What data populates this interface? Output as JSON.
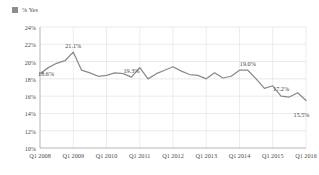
{
  "legend": {
    "label": "% Yes",
    "swatch_color": "#8d8d8d"
  },
  "axes": {
    "y_ticks": [
      "24%",
      "22%",
      "20%",
      "18%",
      "16%",
      "14%",
      "12%",
      "10%"
    ],
    "x_ticks": [
      "Q1 2008",
      "Q1 2009",
      "Q1 2010",
      "Q1 2011",
      "Q1 2012",
      "Q1 2013",
      "Q1 2014",
      "Q1 2015",
      "Q1 2016"
    ]
  },
  "callouts": [
    {
      "text": "18.6%",
      "index": 0
    },
    {
      "text": "21.1%",
      "index": 4
    },
    {
      "text": "19.3%",
      "index": 11
    },
    {
      "text": "19.0%",
      "index": 25
    },
    {
      "text": "17.2%",
      "index": 29
    },
    {
      "text": "15.5%",
      "index": 32
    }
  ],
  "chart_data": {
    "type": "line",
    "title": "",
    "xlabel": "",
    "ylabel": "",
    "ylim": [
      10,
      24
    ],
    "grid": true,
    "legend_position": "top-left",
    "line_color": "#8a8a8a",
    "x": [
      "Q1 2008",
      "Q2 2008",
      "Q3 2008",
      "Q4 2008",
      "Q1 2009",
      "Q2 2009",
      "Q3 2009",
      "Q4 2009",
      "Q1 2010",
      "Q2 2010",
      "Q3 2010",
      "Q4 2010",
      "Q1 2011",
      "Q2 2011",
      "Q3 2011",
      "Q4 2011",
      "Q1 2012",
      "Q2 2012",
      "Q3 2012",
      "Q4 2012",
      "Q1 2013",
      "Q2 2013",
      "Q3 2013",
      "Q4 2013",
      "Q1 2014",
      "Q2 2014",
      "Q3 2014",
      "Q4 2014",
      "Q1 2015",
      "Q2 2015",
      "Q3 2015",
      "Q4 2015",
      "Q1 2016"
    ],
    "series": [
      {
        "name": "% Yes",
        "values": [
          18.6,
          19.3,
          19.8,
          20.1,
          21.1,
          19.0,
          18.7,
          18.3,
          18.4,
          18.7,
          18.6,
          18.2,
          19.3,
          18.0,
          18.6,
          19.0,
          19.4,
          18.9,
          18.5,
          18.4,
          18.0,
          18.7,
          18.1,
          18.3,
          19.0,
          19.0,
          18.0,
          16.9,
          17.2,
          16.0,
          15.9,
          16.4,
          15.5
        ]
      }
    ]
  }
}
